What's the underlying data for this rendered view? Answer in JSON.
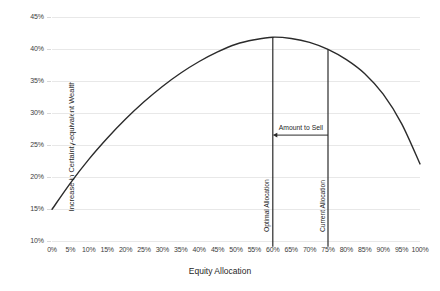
{
  "chart_data": {
    "type": "line",
    "title": "",
    "xlabel": "Equity Allocation",
    "ylabel": "Increase in Certainty-equivalent Wealth",
    "xlim": [
      0,
      100
    ],
    "ylim": [
      10,
      45
    ],
    "grid": true,
    "legend": "none",
    "xticks": [
      "0%",
      "5%",
      "10%",
      "15%",
      "20%",
      "25%",
      "30%",
      "35%",
      "40%",
      "45%",
      "50%",
      "55%",
      "60%",
      "65%",
      "70%",
      "75%",
      "80%",
      "85%",
      "90%",
      "95%",
      "100%"
    ],
    "yticks": [
      "10%",
      "15%",
      "20%",
      "25%",
      "30%",
      "35%",
      "40%",
      "45%"
    ],
    "series": [
      {
        "name": "Increase in Certainty-equivalent Wealth",
        "color": "#2b2b2b",
        "x": [
          0,
          5,
          10,
          15,
          20,
          25,
          30,
          35,
          40,
          45,
          50,
          55,
          60,
          65,
          70,
          75,
          80,
          85,
          90,
          95,
          100
        ],
        "values": [
          14.9,
          19.0,
          22.7,
          26.0,
          29.0,
          31.7,
          34.1,
          36.2,
          38.0,
          39.5,
          40.7,
          41.4,
          41.8,
          41.6,
          41.0,
          39.9,
          38.3,
          36.1,
          32.9,
          28.3,
          22.0
        ]
      }
    ],
    "annotations": [
      {
        "name": "optimal-allocation",
        "type": "vline",
        "x": 60,
        "label": "Optimal Allocation",
        "color": "#2a2a2a"
      },
      {
        "name": "current-allocation",
        "type": "vline",
        "x": 75,
        "label": "Current Allocation",
        "color": "#2a2a2a"
      },
      {
        "name": "amount-to-sell",
        "type": "arrow",
        "from_x": 75,
        "to_x": 60,
        "y": 26.5,
        "label": "Amount to Sell",
        "color": "#2a2a2a"
      }
    ],
    "colors": {
      "curve": "#2b2b2b",
      "gridline": "#e8e8e8",
      "text": "#1f1f1f",
      "background": "#ffffff"
    }
  }
}
